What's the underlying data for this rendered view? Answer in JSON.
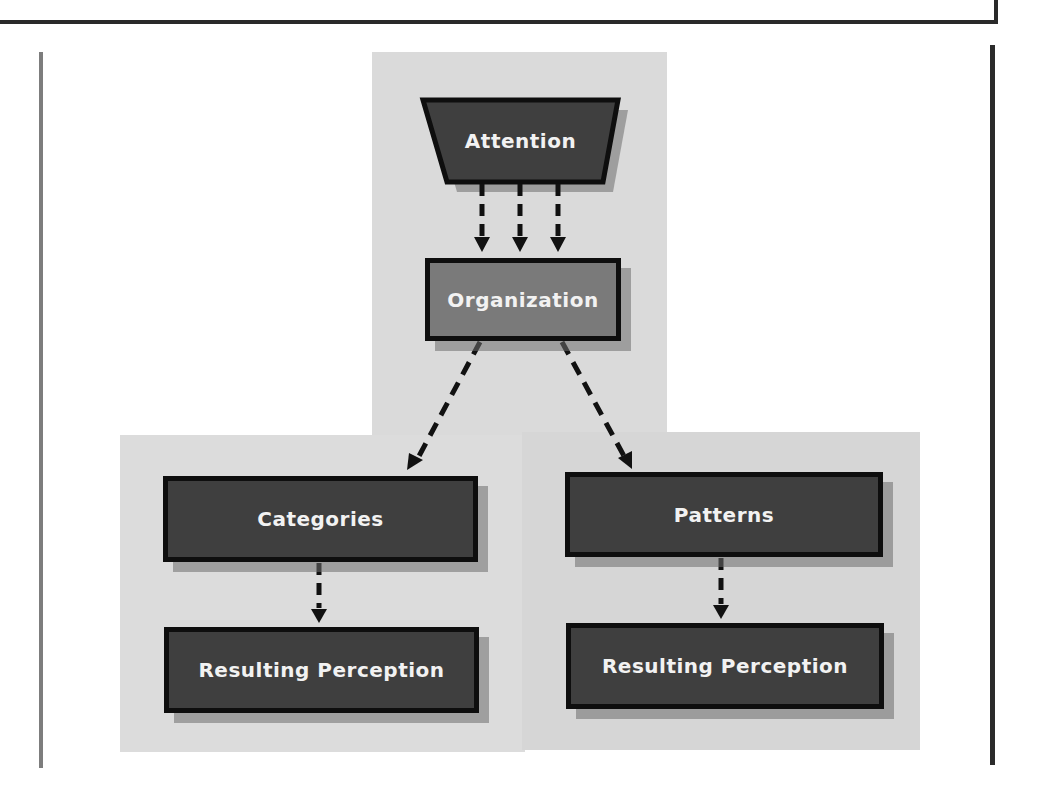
{
  "diagram": {
    "title": "",
    "colors": {
      "node_dark": "#3f3f3f",
      "node_mid": "#7a7a7a",
      "node_border": "#0e0e0e",
      "node_text": "#f2f2f2",
      "panel_bg": "#dadada",
      "arrow": "#111111"
    },
    "nodes": {
      "attention": {
        "label": "Attention",
        "shape": "trapezoid"
      },
      "organization": {
        "label": "Organization",
        "shape": "rectangle"
      },
      "categories": {
        "label": "Categories",
        "shape": "rectangle"
      },
      "patterns": {
        "label": "Patterns",
        "shape": "rectangle"
      },
      "perception_left": {
        "label": "Resulting Perception",
        "shape": "rectangle"
      },
      "perception_right": {
        "label": "Resulting Perception",
        "shape": "rectangle"
      }
    },
    "edges": [
      {
        "from": "attention",
        "to": "organization",
        "style": "dashed",
        "count": 3
      },
      {
        "from": "organization",
        "to": "categories",
        "style": "dashed"
      },
      {
        "from": "organization",
        "to": "patterns",
        "style": "dashed"
      },
      {
        "from": "categories",
        "to": "perception_left",
        "style": "dashed"
      },
      {
        "from": "patterns",
        "to": "perception_right",
        "style": "dashed"
      }
    ]
  }
}
